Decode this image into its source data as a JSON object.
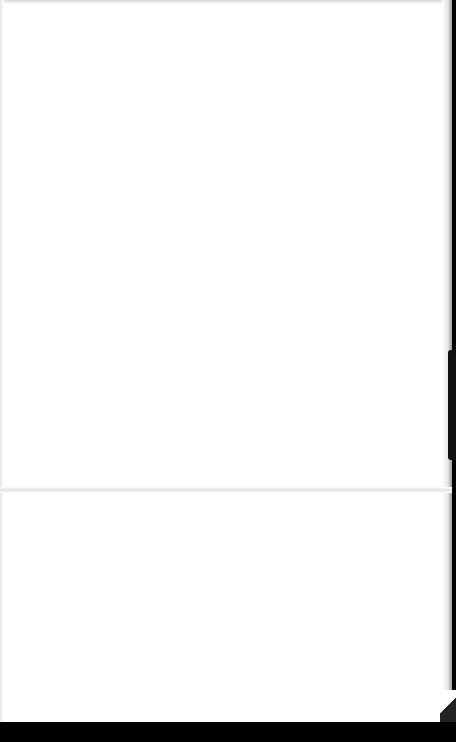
{
  "document": {
    "type": "scanned blank page",
    "content": "",
    "features": {
      "fold_line": "horizontal crease near middle",
      "page_edge": "dark right edge with curled bottom-right corner",
      "background": "black scanner bed at bottom"
    }
  },
  "colors": {
    "page": "#ffffff",
    "scanner_bed": "#000000"
  }
}
